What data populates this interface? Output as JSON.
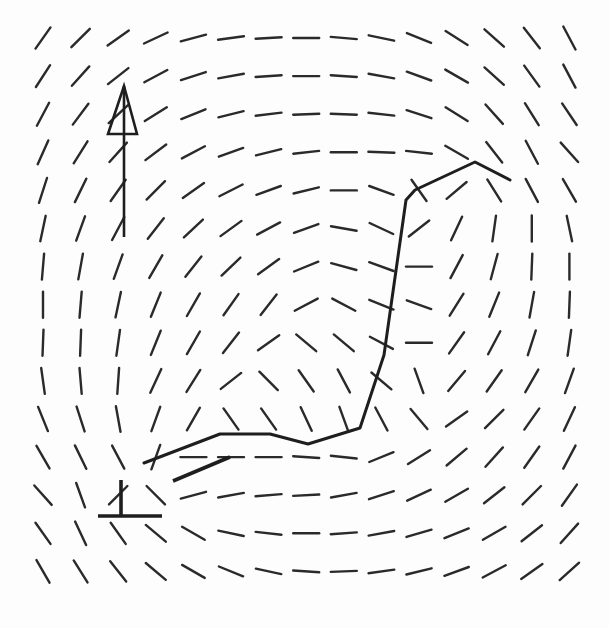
{
  "figure": {
    "type": "orientation-line-field",
    "background": "#fdfdfd",
    "ink_color": "#222222",
    "grid": {
      "cols": 15,
      "rows": 15,
      "x0": 43,
      "y0": 38,
      "dx": 37.6,
      "dy": 38.1,
      "segment_length": 26,
      "angles_deg_note": "0 = horizontal, positive = rising to the right (/), negative = falling to the right (\\), 90 = vertical",
      "angles_deg": [
        [
          55,
          45,
          35,
          25,
          15,
          8,
          3,
          0,
          -5,
          -12,
          -22,
          -32,
          -42,
          -52,
          -62
        ],
        [
          57,
          48,
          38,
          28,
          18,
          10,
          4,
          0,
          -4,
          -10,
          -20,
          -30,
          -42,
          -54,
          -62
        ],
        [
          62,
          53,
          43,
          32,
          22,
          14,
          7,
          2,
          -2,
          -6,
          -18,
          -32,
          -48,
          -58,
          -56
        ],
        [
          66,
          58,
          48,
          37,
          28,
          20,
          14,
          6,
          0,
          -2,
          -6,
          -30,
          -52,
          -62,
          -48
        ],
        [
          72,
          64,
          55,
          45,
          35,
          27,
          20,
          14,
          0,
          -20,
          -55,
          40,
          -58,
          -62,
          -60
        ],
        [
          78,
          70,
          62,
          52,
          43,
          36,
          28,
          20,
          -10,
          -25,
          38,
          65,
          82,
          90,
          -78
        ],
        [
          85,
          80,
          70,
          60,
          52,
          44,
          36,
          22,
          -15,
          -20,
          0,
          62,
          75,
          88,
          90
        ],
        [
          90,
          85,
          78,
          68,
          60,
          55,
          52,
          28,
          -28,
          -22,
          -20,
          58,
          68,
          80,
          88
        ],
        [
          88,
          88,
          82,
          68,
          60,
          52,
          35,
          -40,
          -40,
          -28,
          0,
          55,
          62,
          72,
          82
        ],
        [
          -82,
          -85,
          86,
          65,
          58,
          38,
          -45,
          -55,
          -62,
          -40,
          -70,
          50,
          55,
          60,
          70
        ],
        [
          -68,
          -72,
          -80,
          70,
          60,
          -55,
          -55,
          -65,
          -70,
          -62,
          -50,
          35,
          45,
          55,
          65
        ],
        [
          -60,
          -64,
          -62,
          70,
          0,
          0,
          0,
          -4,
          -6,
          22,
          32,
          40,
          48,
          55,
          62
        ],
        [
          -48,
          -70,
          45,
          -45,
          15,
          10,
          5,
          3,
          10,
          18,
          25,
          30,
          38,
          45,
          55
        ],
        [
          -55,
          -65,
          -55,
          -40,
          -30,
          -12,
          -6,
          0,
          4,
          10,
          16,
          22,
          30,
          38,
          48
        ],
        [
          -60,
          -58,
          -52,
          -40,
          -30,
          -22,
          -12,
          -4,
          2,
          8,
          14,
          20,
          28,
          35,
          42
        ]
      ]
    },
    "path": {
      "label": "trajectory",
      "points": [
        [
          144,
          463
        ],
        [
          220,
          434
        ],
        [
          270,
          434
        ],
        [
          308,
          444
        ],
        [
          360,
          428
        ],
        [
          384,
          355
        ],
        [
          406,
          200
        ],
        [
          415,
          190
        ],
        [
          475,
          162
        ],
        [
          510,
          180
        ]
      ]
    },
    "markers": {
      "north_arrow": {
        "shaft": [
          [
            124,
            86
          ],
          [
            124,
            237
          ]
        ],
        "flag": [
          [
            124,
            86
          ],
          [
            137,
            134
          ],
          [
            108,
            134
          ]
        ]
      },
      "base_marker": {
        "vertical": [
          [
            121,
            480
          ],
          [
            121,
            517
          ]
        ],
        "horizontal": [
          [
            98,
            516
          ],
          [
            162,
            516
          ]
        ]
      },
      "thick_segment": [
        [
          173,
          481
        ],
        [
          230,
          457
        ]
      ]
    }
  }
}
